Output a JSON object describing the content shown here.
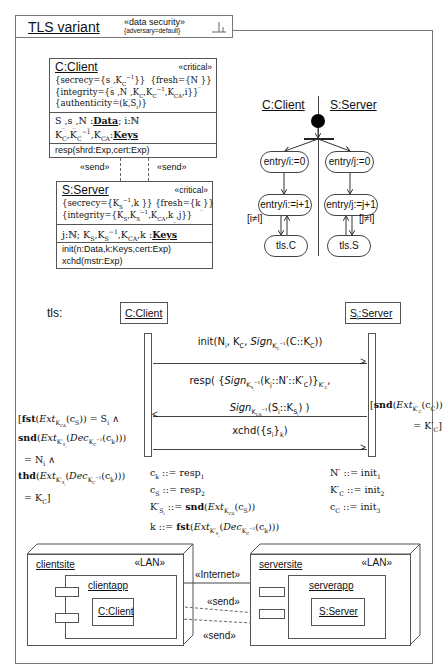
{
  "frame": {
    "title": "TLS variant",
    "stereotype": "«data security»",
    "tag": "{adversary=default}",
    "corner_icon": "fork-icon"
  },
  "client_class": {
    "name": "C:Client",
    "stereotype": "«critical»",
    "tags": [
      "{secrecy={s_,K_C^-1}}  {fresh={N_}}",
      "{integrity={s_,N_,K_C,K_C^-1,K_CA,i}}",
      "{authenticity=(k,S_i)}"
    ],
    "attributes": [
      "S_,s_,N_: Data; i: ℕ",
      "K_C,K_C^-1,K_CA: Keys"
    ],
    "operations": [
      "resp(shrd:Exp,cert:Exp)"
    ]
  },
  "send_labels": [
    "«send»",
    "«send»"
  ],
  "server_class": {
    "name": "S:Server",
    "stereotype": "«critical»",
    "tags": [
      "{secrecy={K_S^-1,k_}} {fresh={k_}}",
      "{integrity={K_S,K_S^-1,K_CA,k_,j}}"
    ],
    "attributes": [
      "j: ℕ;  K_S,K_S^-1,K_CA,k_: Keys"
    ],
    "operations": [
      "init(n:Data,k:Keys,cert:Exp)",
      "xchd(mstr:Exp)"
    ]
  },
  "activity": {
    "swimlanes": [
      "C:Client",
      "S:Server"
    ],
    "client_states": [
      "entry/i:=0",
      "entry/i:=i+1",
      "tls.C"
    ],
    "server_states": [
      "entry/j:=0",
      "entry/j:=j+1",
      "tls.S"
    ],
    "client_guard": "[i≠l]",
    "server_guard": "[j≠l]"
  },
  "sequence": {
    "label": "tls:",
    "lifelines": [
      "C:Client",
      "S_i:Server"
    ],
    "messages": [
      {
        "text": "init(N_i, K_C, Sign_{K_C^-1}(C::K_C))",
        "direction": "right"
      },
      {
        "text": "resp({Sign_{K_Si^-1}(k_j::N'::K'_C)}_{K'_C}, Sign_{K_CA^-1}(S_i::K_Si))",
        "direction": "left"
      },
      {
        "text": "xchd({s_i}_k)",
        "direction": "right"
      }
    ],
    "client_guard": "[fst(Ext_{K_CA}(c_S)) = S_i ∧ snd(Ext_{K'_Si}(Dec_{K_C^-1}(c_k))) = N_i ∧ thd(Ext_{K'_Si}(Dec_{K_C^-1}(c_k))) = K_C]",
    "server_guard": "[snd(Ext_{K'_C}(c_C)) = K'_C]",
    "client_assignments": [
      "c_k ::= resp_1",
      "c_S ::= resp_2",
      "K'_Si ::= snd(Ext_{K_CA}(c_S))",
      "k ::= fst(Ext_{K'_Si}(Dec_{K_C^-1}(c_k)))"
    ],
    "server_assignments": [
      "N' ::= init_1",
      "K'_C ::= init_2",
      "c_C ::= init_3"
    ]
  },
  "deployment": {
    "client_node": {
      "name": "clientsite",
      "stereotype": "«LAN»",
      "component": "clientapp",
      "object": "C:Client"
    },
    "server_node": {
      "name": "serversite",
      "stereotype": "«LAN»",
      "component": "serverapp",
      "object": "S:Server"
    },
    "link_label": "«Internet»",
    "dependency_labels": [
      "«send»",
      "«send»"
    ]
  }
}
